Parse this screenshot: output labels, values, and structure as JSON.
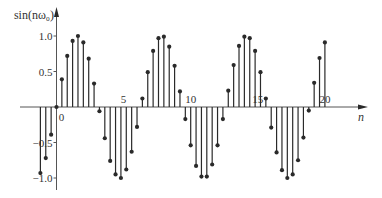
{
  "chart_data": {
    "type": "stem",
    "title": "",
    "ylabel": "sin(nω₀)",
    "xlabel": "n",
    "xlim": [
      -1.4,
      22.5
    ],
    "ylim": [
      -1.1,
      1.4
    ],
    "xticks": [
      {
        "value": 0,
        "label": "0"
      },
      {
        "value": 5,
        "label": "5"
      },
      {
        "value": 10,
        "label": "10"
      },
      {
        "value": 15,
        "label": "15"
      },
      {
        "value": 20,
        "label": "20"
      }
    ],
    "yticks": [
      {
        "value": 1.0,
        "label": "1.0"
      },
      {
        "value": 0.5,
        "label": "0.5"
      },
      {
        "value": -0.5,
        "label": "−0.5"
      },
      {
        "value": -1.0,
        "label": "−1.0"
      }
    ],
    "grid": false,
    "legend": null,
    "series": [
      {
        "name": "sin(nω₀)",
        "x": [
          -1.2,
          -0.8,
          -0.4,
          0,
          0.4,
          0.8,
          1.2,
          1.6,
          2.0,
          2.4,
          2.8,
          3.2,
          3.6,
          4.0,
          4.4,
          4.8,
          5.2,
          5.6,
          6.0,
          6.4,
          6.8,
          7.2,
          7.6,
          8.0,
          8.4,
          8.8,
          9.2,
          9.6,
          10.0,
          10.4,
          10.8,
          11.2,
          11.6,
          12.0,
          12.4,
          12.8,
          13.2,
          13.6,
          14.0,
          14.4,
          14.8,
          15.2,
          15.6,
          16.0,
          16.4,
          16.8,
          17.2,
          17.6,
          18.0,
          18.4,
          18.8,
          19.2,
          19.6,
          20.0
        ],
        "values": [
          -0.93,
          -0.72,
          -0.39,
          0,
          0.39,
          0.72,
          0.93,
          1.0,
          0.91,
          0.68,
          0.33,
          -0.06,
          -0.44,
          -0.76,
          -0.95,
          -1.0,
          -0.88,
          -0.63,
          -0.28,
          0.12,
          0.49,
          0.79,
          0.97,
          0.99,
          0.85,
          0.58,
          0.22,
          -0.17,
          -0.54,
          -0.83,
          -0.98,
          -0.98,
          -0.81,
          -0.54,
          -0.17,
          0.23,
          0.59,
          0.86,
          0.99,
          0.97,
          0.79,
          0.49,
          0.12,
          -0.29,
          -0.64,
          -0.89,
          -1.0,
          -0.95,
          -0.75,
          -0.43,
          -0.05,
          0.34,
          0.69,
          0.91
        ]
      }
    ]
  },
  "style": {
    "stem_color": "#2a2a2a",
    "axis_color": "#555555",
    "text_color": "#333333"
  }
}
